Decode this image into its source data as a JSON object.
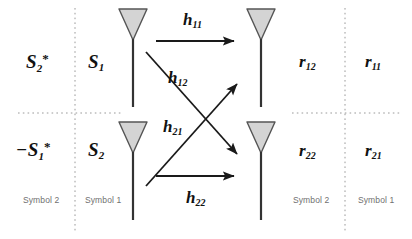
{
  "figure": {
    "colors": {
      "line": "#1a1a1a",
      "antenna_fill": "#d4d4d4",
      "antenna_stroke": "#555555",
      "dashed_guide": "#9a9a9a",
      "caption_text": "#6f6f6f",
      "math_text": "#111111",
      "background": "#ffffff"
    }
  },
  "transmit_symbols": {
    "tx1_slot2": {
      "base": "S",
      "sub": "2",
      "sup": "*",
      "prefix": "",
      "text": "S2*"
    },
    "tx1_slot1": {
      "base": "S",
      "sub": "1",
      "sup": "",
      "prefix": "",
      "text": "S1"
    },
    "tx2_slot2": {
      "base": "S",
      "sub": "1",
      "sup": "*",
      "prefix": "−",
      "text": "-S1*"
    },
    "tx2_slot1": {
      "base": "S",
      "sub": "2",
      "sup": "",
      "prefix": "",
      "text": "S2"
    }
  },
  "receive_symbols": {
    "rx1_slot2": {
      "base": "r",
      "sub": "12",
      "text": "r12"
    },
    "rx1_slot1": {
      "base": "r",
      "sub": "11",
      "text": "r11"
    },
    "rx2_slot2": {
      "base": "r",
      "sub": "22",
      "text": "r22"
    },
    "rx2_slot1": {
      "base": "r",
      "sub": "21",
      "text": "r21"
    }
  },
  "channels": {
    "h11": {
      "base": "h",
      "sub": "11",
      "text": "h11"
    },
    "h12": {
      "base": "h",
      "sub": "12",
      "text": "h12"
    },
    "h21": {
      "base": "h",
      "sub": "21",
      "text": "h21"
    },
    "h22": {
      "base": "h",
      "sub": "22",
      "text": "h22"
    }
  },
  "column_captions": {
    "tx_left": "Symbol 2",
    "tx_right": "Symbol 1",
    "rx_left": "Symbol 2",
    "rx_right": "Symbol 1"
  },
  "antennas": {
    "tx1": "transmit-antenna-1",
    "tx2": "transmit-antenna-2",
    "rx1": "receive-antenna-1",
    "rx2": "receive-antenna-2"
  }
}
